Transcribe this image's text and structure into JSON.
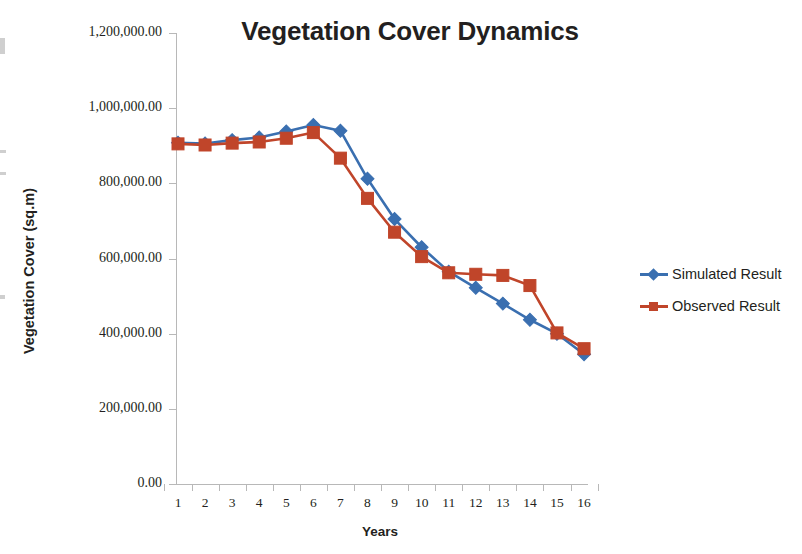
{
  "chart_data": {
    "type": "line",
    "title": "Vegetation Cover Dynamics",
    "xlabel": "Years",
    "ylabel": "Vegetation Cover (sq.m)",
    "categories": [
      "1",
      "2",
      "3",
      "4",
      "5",
      "6",
      "7",
      "8",
      "9",
      "10",
      "11",
      "12",
      "13",
      "14",
      "15",
      "16"
    ],
    "ylim": [
      0,
      1200000
    ],
    "ytick_labels": [
      "1,200,000.00",
      "1,000,000.00",
      "800,000.00",
      "600,000.00",
      "400,000.00",
      "200,000.00",
      "0.00"
    ],
    "ytick_values": [
      1200000,
      1000000,
      800000,
      600000,
      400000,
      200000,
      0
    ],
    "grid": false,
    "legend_position": "right",
    "series": [
      {
        "name": "Simulated Result",
        "color": "#3A6FB0",
        "marker": "diamond",
        "values": [
          908000,
          906000,
          915000,
          922000,
          938000,
          955000,
          940000,
          812000,
          705000,
          630000,
          565000,
          522000,
          480000,
          437000,
          400000,
          345000
        ]
      },
      {
        "name": "Observed Result",
        "color": "#C0452A",
        "marker": "square",
        "values": [
          905000,
          902000,
          907000,
          910000,
          920000,
          935000,
          867000,
          760000,
          670000,
          605000,
          562000,
          558000,
          555000,
          528000,
          402000,
          360000
        ]
      }
    ]
  }
}
